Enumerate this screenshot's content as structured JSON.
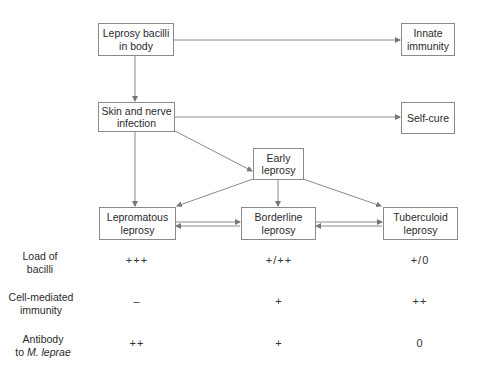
{
  "diagram": {
    "nodes": {
      "bacilli": {
        "line1": "Leprosy bacilli",
        "line2": "in body"
      },
      "innate": {
        "line1": "Innate",
        "line2": "immunity"
      },
      "skin": {
        "line1": "Skin and nerve",
        "line2": "infection"
      },
      "selfcure": {
        "line1": "Self-cure"
      },
      "early": {
        "line1": "Early",
        "line2": "leprosy"
      },
      "lepromatous": {
        "line1": "Lepromatous",
        "line2": "leprosy"
      },
      "borderline": {
        "line1": "Borderline",
        "line2": "leprosy"
      },
      "tuberculoid": {
        "line1": "Tuberculoid",
        "line2": "leprosy"
      }
    },
    "edges": [
      {
        "from": "bacilli",
        "to": "innate"
      },
      {
        "from": "bacilli",
        "to": "skin"
      },
      {
        "from": "skin",
        "to": "selfcure"
      },
      {
        "from": "skin",
        "to": "early"
      },
      {
        "from": "skin",
        "to": "lepromatous"
      },
      {
        "from": "early",
        "to": "lepromatous"
      },
      {
        "from": "early",
        "to": "borderline"
      },
      {
        "from": "early",
        "to": "tuberculoid"
      },
      {
        "from": "lepromatous",
        "to": "borderline"
      },
      {
        "from": "borderline",
        "to": "lepromatous"
      },
      {
        "from": "borderline",
        "to": "tuberculoid"
      },
      {
        "from": "tuberculoid",
        "to": "borderline"
      }
    ]
  },
  "table": {
    "rows": [
      {
        "label1": "Load of",
        "label2": "bacilli",
        "values": [
          "+++",
          "+/++",
          "+/0"
        ]
      },
      {
        "label1": "Cell-mediated",
        "label2": "immunity",
        "values": [
          "–",
          "+",
          "++"
        ]
      },
      {
        "label1": "Antibody",
        "label2_prefix": "to ",
        "label2_italic": "M. leprae",
        "values": [
          "++",
          "+",
          "0"
        ]
      }
    ]
  }
}
